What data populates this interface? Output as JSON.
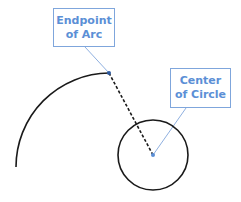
{
  "callouts": {
    "endpoint": {
      "line1": "Endpoint",
      "line2": "of Arc"
    },
    "center": {
      "line1": "Center",
      "line2": "of Circle"
    }
  },
  "colors": {
    "stroke": "#1a1a1a",
    "accent": "#5b8fd6",
    "callout_border": "#7fa6dc"
  },
  "geometry": {
    "arc": {
      "start": [
        16,
        167
      ],
      "end": [
        109,
        73
      ],
      "radius": 94
    },
    "circle": {
      "center": [
        153,
        155
      ],
      "radius": 35
    },
    "dashed_line": {
      "from": [
        109,
        73
      ],
      "to": [
        153,
        155
      ]
    }
  }
}
